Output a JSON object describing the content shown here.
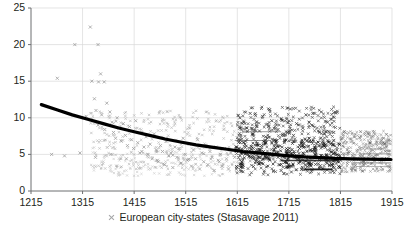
{
  "chart_data": {
    "type": "scatter",
    "title": "",
    "xlabel": "",
    "ylabel": "",
    "xlim": [
      1215,
      1915
    ],
    "ylim": [
      0,
      25
    ],
    "grid": true,
    "x_ticks": [
      1215,
      1315,
      1415,
      1515,
      1615,
      1715,
      1815,
      1915
    ],
    "y_ticks": [
      0,
      5,
      10,
      15,
      20,
      25
    ],
    "x_tick_labels": [
      "1215",
      "1315",
      "1415",
      "1515",
      "1615",
      "1715",
      "1815",
      "1915"
    ],
    "y_tick_labels": [
      "0",
      "5",
      "10",
      "15",
      "20",
      "25"
    ],
    "legend": {
      "position": "bottom-center",
      "entries": [
        {
          "label": "European city-states (Stasavage 2011)",
          "marker": "x",
          "color": "#6d6e71"
        }
      ]
    },
    "series": [
      {
        "name": "European city-states (Stasavage 2011)",
        "marker": "x",
        "color": "#8c8c8c",
        "points": [
          [
            1266,
            15.4
          ],
          [
            1300,
            20.0
          ],
          [
            1330,
            22.4
          ],
          [
            1333,
            15.0
          ],
          [
            1345,
            20.0
          ],
          [
            1350,
            16.0
          ],
          [
            1346,
            14.9
          ],
          [
            1357,
            14.9
          ],
          [
            1318,
            10.0
          ],
          [
            1322,
            10.2
          ],
          [
            1338,
            12.6
          ],
          [
            1341,
            11.0
          ],
          [
            1345,
            9.0
          ],
          [
            1352,
            10.4
          ],
          [
            1358,
            8.4
          ],
          [
            1362,
            12.0
          ],
          [
            1368,
            10.8
          ],
          [
            1372,
            9.4
          ],
          [
            1375,
            8.0
          ],
          [
            1379,
            7.2
          ],
          [
            1382,
            10.0
          ],
          [
            1386,
            8.6
          ],
          [
            1390,
            6.8
          ],
          [
            1394,
            9.2
          ],
          [
            1398,
            7.6
          ],
          [
            1402,
            6.2
          ],
          [
            1406,
            8.8
          ],
          [
            1410,
            7.0
          ],
          [
            1414,
            5.8
          ],
          [
            1418,
            9.6
          ],
          [
            1422,
            6.6
          ],
          [
            1426,
            5.2
          ],
          [
            1430,
            8.0
          ],
          [
            1434,
            6.0
          ],
          [
            1438,
            7.4
          ],
          [
            1442,
            5.0
          ],
          [
            1446,
            6.4
          ],
          [
            1450,
            4.4
          ],
          [
            1454,
            7.8
          ],
          [
            1458,
            5.6
          ],
          [
            1462,
            4.0
          ],
          [
            1466,
            6.2
          ],
          [
            1470,
            5.4
          ],
          [
            1474,
            3.6
          ],
          [
            1478,
            6.8
          ],
          [
            1482,
            4.8
          ],
          [
            1486,
            5.2
          ],
          [
            1490,
            3.2
          ],
          [
            1494,
            6.0
          ],
          [
            1498,
            4.6
          ],
          [
            1502,
            5.8
          ],
          [
            1506,
            3.8
          ],
          [
            1510,
            7.2
          ],
          [
            1514,
            5.0
          ],
          [
            1518,
            4.2
          ],
          [
            1522,
            6.4
          ],
          [
            1526,
            3.4
          ],
          [
            1530,
            5.6
          ],
          [
            1534,
            4.4
          ],
          [
            1538,
            7.0
          ],
          [
            1542,
            3.0
          ],
          [
            1546,
            5.2
          ],
          [
            1550,
            4.0
          ],
          [
            1554,
            6.2
          ],
          [
            1558,
            3.6
          ],
          [
            1562,
            5.4
          ],
          [
            1566,
            4.6
          ],
          [
            1570,
            2.8
          ],
          [
            1574,
            6.0
          ],
          [
            1578,
            4.2
          ],
          [
            1582,
            5.0
          ],
          [
            1586,
            3.4
          ],
          [
            1590,
            5.8
          ],
          [
            1594,
            4.4
          ],
          [
            1598,
            3.0
          ],
          [
            1602,
            5.2
          ],
          [
            1255,
            5.0
          ],
          [
            1280,
            4.8
          ],
          [
            1310,
            5.2
          ],
          [
            1340,
            4.6
          ],
          [
            1370,
            5.0
          ],
          [
            1400,
            4.4
          ],
          [
            1430,
            5.4
          ],
          [
            1460,
            4.2
          ],
          [
            1490,
            4.9
          ],
          [
            1520,
            4.3
          ],
          [
            1550,
            5.1
          ],
          [
            1580,
            4.0
          ],
          [
            1610,
            4.6
          ],
          [
            1640,
            4.1
          ],
          [
            1670,
            4.8
          ],
          [
            1700,
            4.3
          ],
          [
            1730,
            4.5
          ],
          [
            1760,
            4.2
          ],
          [
            1790,
            4.6
          ],
          [
            1820,
            4.4
          ],
          [
            1850,
            4.3
          ],
          [
            1880,
            4.5
          ],
          [
            1905,
            4.4
          ]
        ]
      },
      {
        "name": "later-period-dense",
        "marker": "x",
        "color": "#1a1a1a",
        "points": [
          [
            1620,
            10.0
          ],
          [
            1628,
            9.4
          ],
          [
            1634,
            8.6
          ],
          [
            1640,
            10.6
          ],
          [
            1646,
            7.8
          ],
          [
            1652,
            9.0
          ],
          [
            1658,
            8.2
          ],
          [
            1664,
            10.2
          ],
          [
            1670,
            7.4
          ],
          [
            1676,
            8.8
          ],
          [
            1682,
            9.6
          ],
          [
            1688,
            7.0
          ],
          [
            1694,
            8.4
          ],
          [
            1700,
            9.8
          ],
          [
            1706,
            6.6
          ],
          [
            1712,
            8.0
          ],
          [
            1718,
            11.2
          ],
          [
            1724,
            7.6
          ],
          [
            1730,
            9.2
          ],
          [
            1736,
            6.2
          ],
          [
            1742,
            8.6
          ],
          [
            1748,
            10.4
          ],
          [
            1754,
            7.2
          ],
          [
            1760,
            9.0
          ],
          [
            1766,
            6.0
          ],
          [
            1772,
            8.2
          ],
          [
            1778,
            10.8
          ],
          [
            1784,
            7.8
          ],
          [
            1790,
            9.4
          ],
          [
            1796,
            6.4
          ],
          [
            1802,
            8.0
          ],
          [
            1808,
            5.6
          ],
          [
            1614,
            6.0
          ],
          [
            1622,
            5.2
          ],
          [
            1630,
            6.4
          ],
          [
            1638,
            4.8
          ],
          [
            1646,
            5.8
          ],
          [
            1654,
            4.4
          ],
          [
            1662,
            6.2
          ],
          [
            1670,
            5.0
          ],
          [
            1678,
            4.2
          ],
          [
            1686,
            5.6
          ],
          [
            1694,
            4.6
          ],
          [
            1702,
            6.0
          ],
          [
            1710,
            4.0
          ],
          [
            1718,
            5.4
          ],
          [
            1726,
            4.8
          ],
          [
            1734,
            3.8
          ],
          [
            1742,
            5.2
          ],
          [
            1750,
            4.4
          ],
          [
            1758,
            3.4
          ],
          [
            1766,
            5.0
          ],
          [
            1774,
            4.2
          ],
          [
            1782,
            3.0
          ],
          [
            1790,
            4.8
          ],
          [
            1798,
            3.6
          ],
          [
            1806,
            4.4
          ],
          [
            1814,
            3.2
          ],
          [
            1700,
            2.8
          ],
          [
            1720,
            2.6
          ],
          [
            1740,
            3.0
          ],
          [
            1760,
            2.9
          ],
          [
            1780,
            3.1
          ],
          [
            1800,
            2.7
          ]
        ]
      }
    ],
    "trend_line": {
      "color": "#000000",
      "width": 3.2,
      "points": [
        [
          1235,
          11.8
        ],
        [
          1265,
          11.1
        ],
        [
          1295,
          10.4
        ],
        [
          1325,
          9.8
        ],
        [
          1355,
          9.2
        ],
        [
          1385,
          8.6
        ],
        [
          1415,
          8.1
        ],
        [
          1445,
          7.6
        ],
        [
          1475,
          7.1
        ],
        [
          1505,
          6.7
        ],
        [
          1535,
          6.3
        ],
        [
          1565,
          6.0
        ],
        [
          1595,
          5.7
        ],
        [
          1625,
          5.4
        ],
        [
          1655,
          5.2
        ],
        [
          1685,
          5.0
        ],
        [
          1715,
          4.8
        ],
        [
          1745,
          4.65
        ],
        [
          1775,
          4.55
        ],
        [
          1805,
          4.45
        ],
        [
          1835,
          4.4
        ],
        [
          1865,
          4.35
        ],
        [
          1895,
          4.32
        ],
        [
          1913,
          4.3
        ]
      ]
    },
    "style": {
      "axis_color": "#6d6e71",
      "grid_color": "#d9d9d9",
      "tick_label_color": "#231f20",
      "background": "#ffffff"
    }
  }
}
